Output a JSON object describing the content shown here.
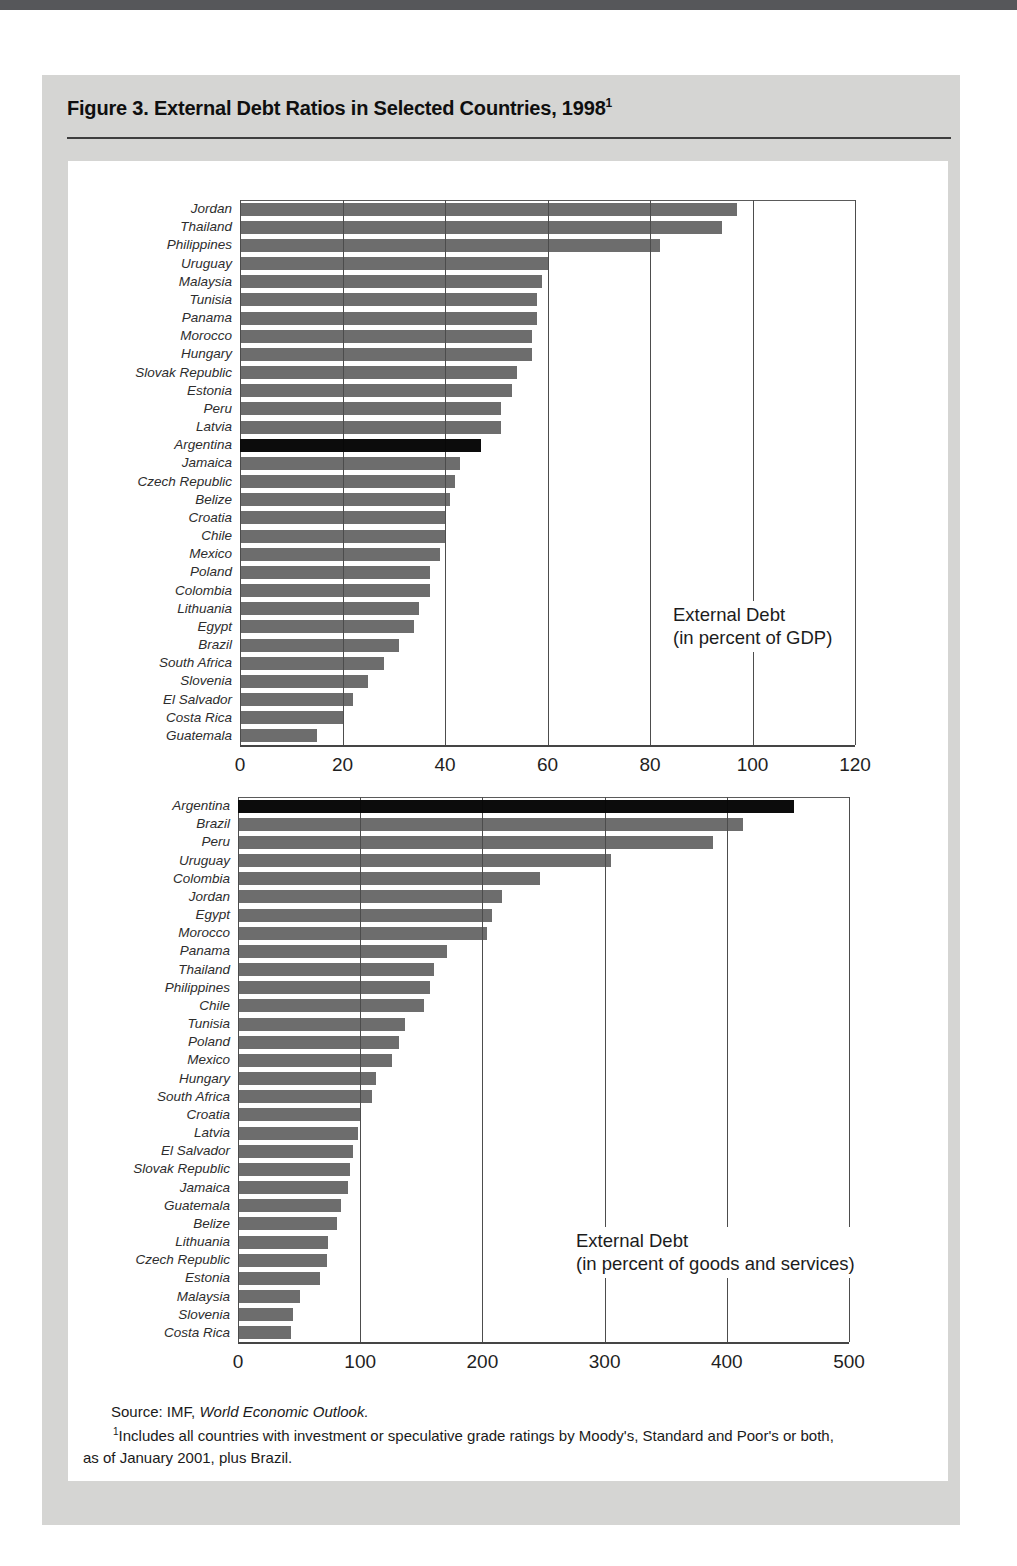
{
  "page": {
    "title": "Figure 3. External Debt Ratios in Selected Countries, 1998",
    "title_footnote_marker": "1"
  },
  "footer": {
    "source_prefix": "Source: IMF,",
    "source_italic": "World Economic Outlook.",
    "footnote_marker": "1",
    "footnote_text": "Includes all countries with investment or speculative grade ratings by Moody's, Standard and Poor's or both,",
    "footnote_text_line2": "as of January 2001, plus Brazil."
  },
  "colors": {
    "bar": "#6d6d6d",
    "highlight_bar": "#0c0c0c",
    "panel": "#d5d5d3",
    "top_stripe": "#56575a",
    "gridline": "#6f6f6f"
  },
  "chart_data": [
    {
      "type": "bar",
      "orientation": "horizontal",
      "legend_line1": "External Debt",
      "legend_line2": "(in percent of GDP)",
      "xlim": [
        0,
        120
      ],
      "xticks": [
        0,
        20,
        40,
        60,
        80,
        100,
        120
      ],
      "grid": true,
      "highlight": "Argentina",
      "points": [
        {
          "label": "Jordan",
          "value": 97
        },
        {
          "label": "Thailand",
          "value": 94
        },
        {
          "label": "Philippines",
          "value": 82
        },
        {
          "label": "Uruguay",
          "value": 60
        },
        {
          "label": "Malaysia",
          "value": 59
        },
        {
          "label": "Tunisia",
          "value": 58
        },
        {
          "label": "Panama",
          "value": 58
        },
        {
          "label": "Morocco",
          "value": 57
        },
        {
          "label": "Hungary",
          "value": 57
        },
        {
          "label": "Slovak Republic",
          "value": 54
        },
        {
          "label": "Estonia",
          "value": 53
        },
        {
          "label": "Peru",
          "value": 51
        },
        {
          "label": "Latvia",
          "value": 51
        },
        {
          "label": "Argentina",
          "value": 47
        },
        {
          "label": "Jamaica",
          "value": 43
        },
        {
          "label": "Czech Republic",
          "value": 42
        },
        {
          "label": "Belize",
          "value": 41
        },
        {
          "label": "Croatia",
          "value": 40
        },
        {
          "label": "Chile",
          "value": 40
        },
        {
          "label": "Mexico",
          "value": 39
        },
        {
          "label": "Poland",
          "value": 37
        },
        {
          "label": "Colombia",
          "value": 37
        },
        {
          "label": "Lithuania",
          "value": 35
        },
        {
          "label": "Egypt",
          "value": 34
        },
        {
          "label": "Brazil",
          "value": 31
        },
        {
          "label": "South Africa",
          "value": 28
        },
        {
          "label": "Slovenia",
          "value": 25
        },
        {
          "label": "El Salvador",
          "value": 22
        },
        {
          "label": "Costa Rica",
          "value": 20
        },
        {
          "label": "Guatemala",
          "value": 15
        }
      ]
    },
    {
      "type": "bar",
      "orientation": "horizontal",
      "legend_line1": "External Debt",
      "legend_line2": "(in percent of goods and services)",
      "xlim": [
        0,
        500
      ],
      "xticks": [
        0,
        100,
        200,
        300,
        400,
        500
      ],
      "grid": true,
      "highlight": "Argentina",
      "points": [
        {
          "label": "Argentina",
          "value": 455
        },
        {
          "label": "Brazil",
          "value": 413
        },
        {
          "label": "Peru",
          "value": 389
        },
        {
          "label": "Uruguay",
          "value": 305
        },
        {
          "label": "Colombia",
          "value": 247
        },
        {
          "label": "Jordan",
          "value": 216
        },
        {
          "label": "Egypt",
          "value": 208
        },
        {
          "label": "Morocco",
          "value": 204
        },
        {
          "label": "Panama",
          "value": 171
        },
        {
          "label": "Thailand",
          "value": 160
        },
        {
          "label": "Philippines",
          "value": 157
        },
        {
          "label": "Chile",
          "value": 152
        },
        {
          "label": "Tunisia",
          "value": 137
        },
        {
          "label": "Poland",
          "value": 132
        },
        {
          "label": "Mexico",
          "value": 126
        },
        {
          "label": "Hungary",
          "value": 113
        },
        {
          "label": "South Africa",
          "value": 110
        },
        {
          "label": "Croatia",
          "value": 101
        },
        {
          "label": "Latvia",
          "value": 98
        },
        {
          "label": "El Salvador",
          "value": 94
        },
        {
          "label": "Slovak Republic",
          "value": 92
        },
        {
          "label": "Jamaica",
          "value": 90
        },
        {
          "label": "Guatemala",
          "value": 84
        },
        {
          "label": "Belize",
          "value": 81
        },
        {
          "label": "Lithuania",
          "value": 74
        },
        {
          "label": "Czech Republic",
          "value": 73
        },
        {
          "label": "Estonia",
          "value": 67
        },
        {
          "label": "Malaysia",
          "value": 51
        },
        {
          "label": "Slovenia",
          "value": 45
        },
        {
          "label": "Costa Rica",
          "value": 43
        }
      ]
    }
  ]
}
